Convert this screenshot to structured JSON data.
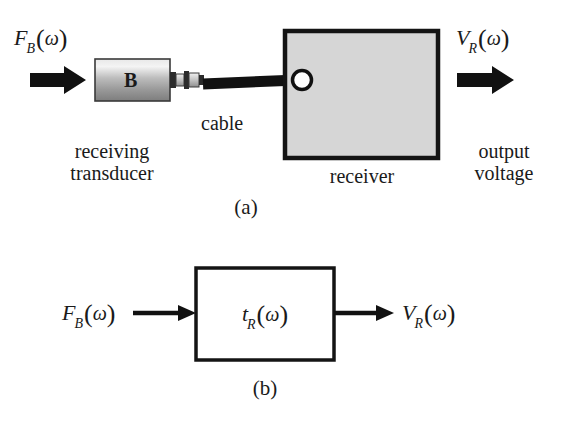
{
  "figure": {
    "background_color": "#ffffff",
    "ink_color": "#1a1a1a",
    "panels": [
      {
        "id": "a",
        "caption": "(a)",
        "input_label": {
          "symbol": "F",
          "subscript": "B",
          "argument": "ω",
          "text": "F_B(ω)"
        },
        "output_label": {
          "symbol": "V",
          "subscript": "R",
          "argument": "ω",
          "text": "V_R(ω)"
        },
        "transducer": {
          "body_label": "B",
          "name_line1": "receiving",
          "name_line2": "transducer",
          "fill_light": "#f2f2f2",
          "fill_dark": "#8c8c8c"
        },
        "cable": {
          "label": "cable",
          "color": "#111111"
        },
        "receiver": {
          "label": "receiver",
          "fill": "#d6d6d6",
          "stroke": "#141414"
        },
        "output_text_line1": "output",
        "output_text_line2": "voltage"
      },
      {
        "id": "b",
        "caption": "(b)",
        "input_label": {
          "symbol": "F",
          "subscript": "B",
          "argument": "ω",
          "text": "F_B(ω)"
        },
        "block_label": {
          "symbol": "t",
          "subscript": "R",
          "argument": "ω",
          "text": "t_R(ω)"
        },
        "output_label": {
          "symbol": "V",
          "subscript": "R",
          "argument": "ω",
          "text": "V_R(ω)"
        },
        "block": {
          "fill": "#ffffff",
          "stroke": "#141414"
        }
      }
    ]
  }
}
